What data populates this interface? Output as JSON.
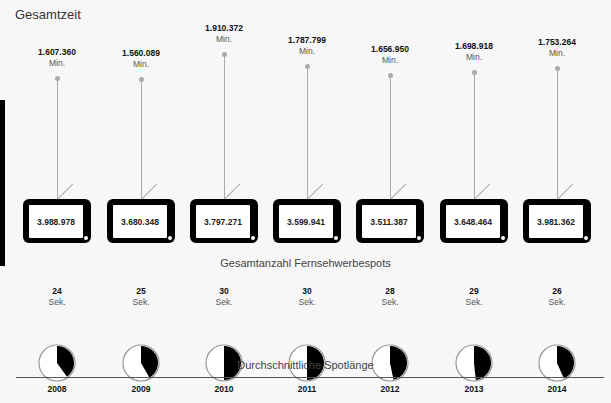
{
  "title": "Gesamtzeit",
  "section_labels": {
    "spots": "Gesamtanzahl Fernsehwerbespots",
    "length": "Durchschnittliche Spotlänge"
  },
  "units": {
    "minutes": "Min.",
    "seconds": "Sek."
  },
  "chart_data": {
    "type": "pictogram",
    "title": "Gesamtzeit",
    "categories": [
      "2008",
      "2009",
      "2010",
      "2011",
      "2012",
      "2013",
      "2014"
    ],
    "series": [
      {
        "name": "Gesamtzeit (Min.)",
        "labels": [
          "1.607.360",
          "1.560.089",
          "1.910.372",
          "1.787.799",
          "1.656.950",
          "1.698.918",
          "1.753.264"
        ],
        "values": [
          1607360,
          1560089,
          1910372,
          1787799,
          1656950,
          1698918,
          1753264
        ]
      },
      {
        "name": "Gesamtanzahl Fernsehwerbespots",
        "labels": [
          "3.988.978",
          "3.680.348",
          "3.797.271",
          "3.599.941",
          "3.511.387",
          "3.648.464",
          "3.981.362"
        ],
        "values": [
          3988978,
          3680348,
          3797271,
          3599941,
          3511387,
          3648464,
          3981362
        ]
      },
      {
        "name": "Durchschnittliche Spotlänge (Sek.)",
        "values": [
          24,
          25,
          30,
          30,
          28,
          29,
          26
        ]
      }
    ],
    "xlabel": "",
    "ylabel": ""
  },
  "years": [
    {
      "year": "2008",
      "minutes": "1.607.360",
      "spots": "3.988.978",
      "seconds": "24"
    },
    {
      "year": "2009",
      "minutes": "1.560.089",
      "spots": "3.680.348",
      "seconds": "25"
    },
    {
      "year": "2010",
      "minutes": "1.910.372",
      "spots": "3.797.271",
      "seconds": "30"
    },
    {
      "year": "2011",
      "minutes": "1.787.799",
      "spots": "3.599.941",
      "seconds": "30"
    },
    {
      "year": "2012",
      "minutes": "1.656.950",
      "spots": "3.511.387",
      "seconds": "28"
    },
    {
      "year": "2013",
      "minutes": "1.698.918",
      "spots": "3.648.464",
      "seconds": "29"
    },
    {
      "year": "2014",
      "minutes": "1.753.264",
      "spots": "3.981.362",
      "seconds": "26"
    }
  ],
  "colors": {
    "pin": "#aaaaaa",
    "tv": "#000000",
    "pie_fill": "#000000",
    "pie_ring": "#999999"
  }
}
